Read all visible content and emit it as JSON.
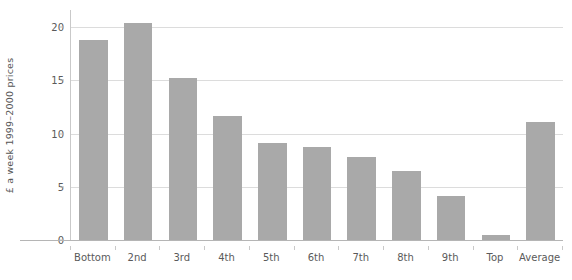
{
  "chart_data": {
    "type": "bar",
    "title": "",
    "xlabel": "",
    "ylabel": "£ a week 1999–2000 prices",
    "categories": [
      "Bottom",
      "2nd",
      "3rd",
      "4th",
      "5th",
      "6th",
      "7th",
      "8th",
      "9th",
      "Top",
      "Average"
    ],
    "values": [
      18.8,
      20.4,
      15.2,
      11.6,
      9.1,
      8.7,
      7.8,
      6.5,
      4.1,
      0.5,
      11.1
    ],
    "ylim": [
      0,
      21.6
    ],
    "yticks": [
      0,
      5,
      10,
      15,
      20
    ],
    "ytick_labels": [
      "0",
      "5",
      "10",
      "15",
      "20"
    ],
    "grid": true,
    "legend": false,
    "legend_position": "none",
    "bar_color": "#a9a9a9",
    "gridline_color": "#dcdcdc",
    "axis_color": "#b5b5b5",
    "text_color": "#5a5a5a"
  }
}
